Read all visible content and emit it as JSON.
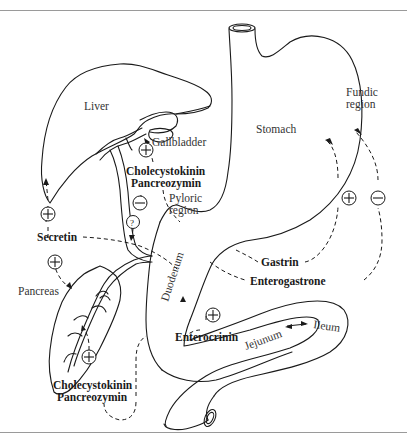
{
  "diagram": {
    "organs": {
      "liver": "Liver",
      "gallbladder": "Gallbladder",
      "stomach": "Stomach",
      "fundic_region_line1": "Fundic",
      "fundic_region_line2": "region",
      "pyloric_region_line1": "Pyloric",
      "pyloric_region_line2": "region",
      "pancreas": "Pancreas",
      "duodenum": "Duodenum",
      "jejunum": "Jejunum",
      "ileum": "Ileum"
    },
    "hormones": {
      "cck_top_line1": "Cholecystokinin",
      "cck_top_line2": "Pancreozymin",
      "cck_bottom_line1": "Cholecystokinin",
      "cck_bottom_line2": "Pancreozymin",
      "secretin": "Secretin",
      "gastrin": "Gastrin",
      "enterogastrone": "Enterogastrone",
      "enterocrinin": "Enterocrinin"
    },
    "symbols": {
      "plus": "+",
      "minus": "−",
      "unknown": "?"
    },
    "effects": [
      {
        "hormone": "Cholecystokinin Pancreozymin",
        "target": "Gallbladder",
        "effect": "+"
      },
      {
        "hormone": "Cholecystokinin Pancreozymin",
        "target": "Pyloric region",
        "effect": "−"
      },
      {
        "hormone": "Unknown",
        "target": "Bile duct",
        "effect": "?"
      },
      {
        "hormone": "Secretin",
        "target": "Liver",
        "effect": "+"
      },
      {
        "hormone": "Secretin",
        "target": "Pancreas",
        "effect": "+"
      },
      {
        "hormone": "Cholecystokinin Pancreozymin",
        "target": "Pancreas",
        "effect": "+"
      },
      {
        "hormone": "Gastrin",
        "target": "Fundic region",
        "effect": "+"
      },
      {
        "hormone": "Enterogastrone",
        "target": "Fundic region",
        "effect": "−"
      },
      {
        "hormone": "Enterocrinin",
        "target": "Duodenum",
        "effect": "+"
      }
    ]
  }
}
